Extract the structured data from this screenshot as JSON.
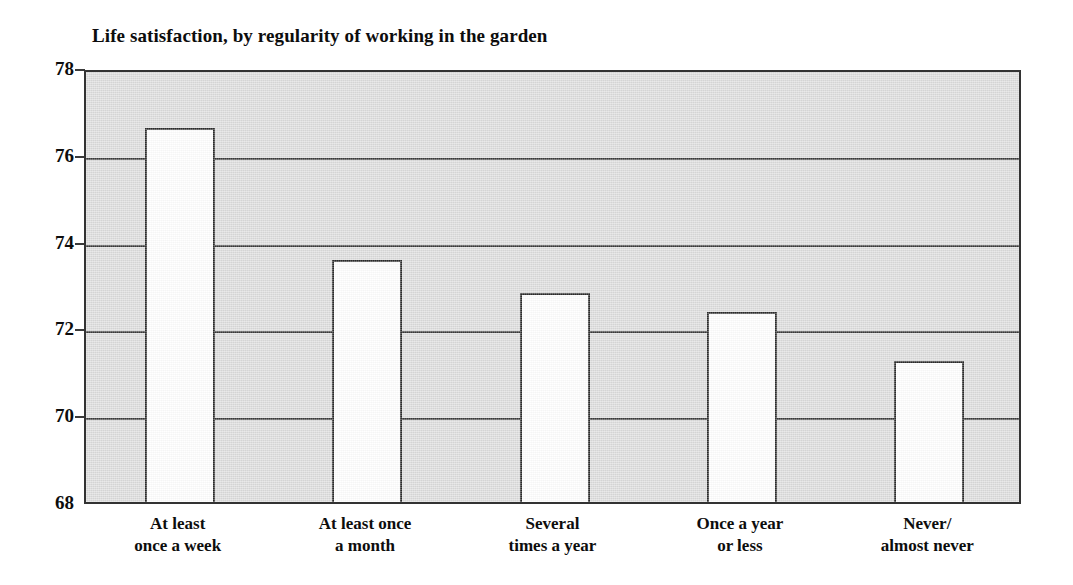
{
  "chart_data": {
    "type": "bar",
    "title": "Life satisfaction, by regularity of working in the garden",
    "xlabel": "",
    "ylabel": "",
    "ylim": [
      68,
      78
    ],
    "ytick_values": [
      78,
      76,
      74,
      72,
      70,
      68
    ],
    "ytick_labels": [
      "78",
      "76",
      "74",
      "72",
      "70",
      "68"
    ],
    "grid": true,
    "legend": false,
    "legend_position": "none",
    "plot_background": "#dcdcdc",
    "bar_fill": "#ffffff",
    "bar_edge": "#2b2b2b",
    "categories": [
      "At least\nonce a week",
      "At least once\na month",
      "Several\ntimes a year",
      "Once a year\nor less",
      "Never/\nalmost never"
    ],
    "values": [
      76.7,
      73.67,
      72.9,
      72.47,
      71.35
    ]
  }
}
